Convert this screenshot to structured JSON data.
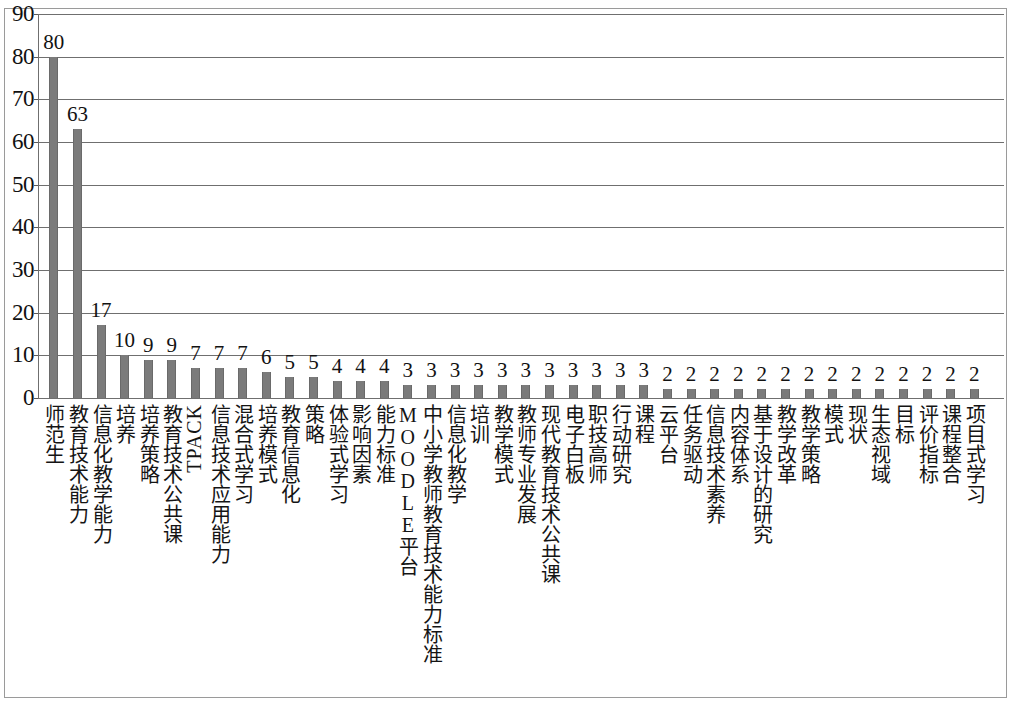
{
  "chart_data": {
    "type": "bar",
    "title": "",
    "subtitle": "",
    "xlabel": "",
    "ylabel": "",
    "ylim": [
      0,
      90
    ],
    "y_ticks": [
      0,
      10,
      20,
      30,
      40,
      50,
      60,
      70,
      80,
      90
    ],
    "grid": true,
    "grid_axis": "y",
    "legend": false,
    "legend_position": "none",
    "bar_color": "#7b7b7b",
    "gridline_color": "#6f6f6f",
    "data_labels_shown": true,
    "orientation": "vertical",
    "categories": [
      "师范生",
      "教育技术能力",
      "信息化教学能力",
      "培养",
      "培养策略",
      "教育技术公共课",
      "TPACK",
      "信息技术应用能力",
      "混合式学习",
      "培养模式",
      "教育信息化",
      "策略",
      "体验式学习",
      "影响因素",
      "能力标准",
      "MOODLE平台",
      "中小学教师教育技术能力标准",
      "信息化教学",
      "培训",
      "教学模式",
      "教师专业发展",
      "现代教育技术公共课",
      "电子白板",
      "职技高师",
      "行动研究",
      "课程",
      "云平台",
      "任务驱动",
      "信息技术素养",
      "内容体系",
      "基于设计的研究",
      "教学改革",
      "教学策略",
      "模式",
      "现状",
      "生态视域",
      "目标",
      "评价指标",
      "课程整合",
      "项目式学习"
    ],
    "values": [
      80,
      63,
      17,
      10,
      9,
      9,
      7,
      7,
      7,
      6,
      5,
      5,
      4,
      4,
      4,
      3,
      3,
      3,
      3,
      3,
      3,
      3,
      3,
      3,
      3,
      3,
      2,
      2,
      2,
      2,
      2,
      2,
      2,
      2,
      2,
      2,
      2,
      2,
      2,
      2
    ]
  }
}
